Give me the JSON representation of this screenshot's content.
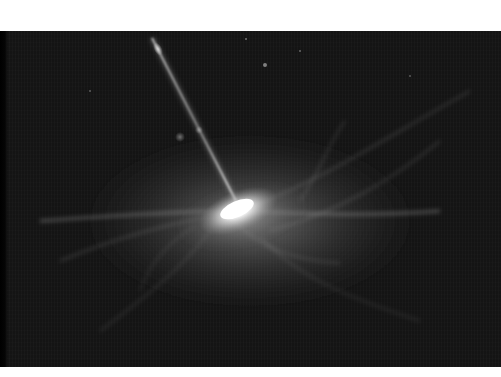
{
  "image": {
    "alt": "Artist's rendering of a quasar: a bright glowing accretion disk with a thin relativistic jet shooting up and to the left, surrounded by faint whitish gas filaments against a dark starfield",
    "subject": "quasar-with-jet",
    "palette": {
      "background": "#141414",
      "frame": "#ffffff",
      "glow": "#ffffff",
      "filament": "#bdbdbd"
    },
    "regions": {
      "top_band_height": 31,
      "photo_top": 31,
      "photo_height": 336,
      "bottom_band_height": 10
    },
    "features": {
      "disk_center": [
        238,
        177
      ],
      "jet_start": [
        152,
        7
      ],
      "jet_end": [
        236,
        170
      ],
      "jet_knot": [
        157,
        17
      ],
      "blobs": [
        [
          180,
          106
        ],
        [
          198,
          98
        ],
        [
          265,
          34
        ]
      ]
    }
  }
}
